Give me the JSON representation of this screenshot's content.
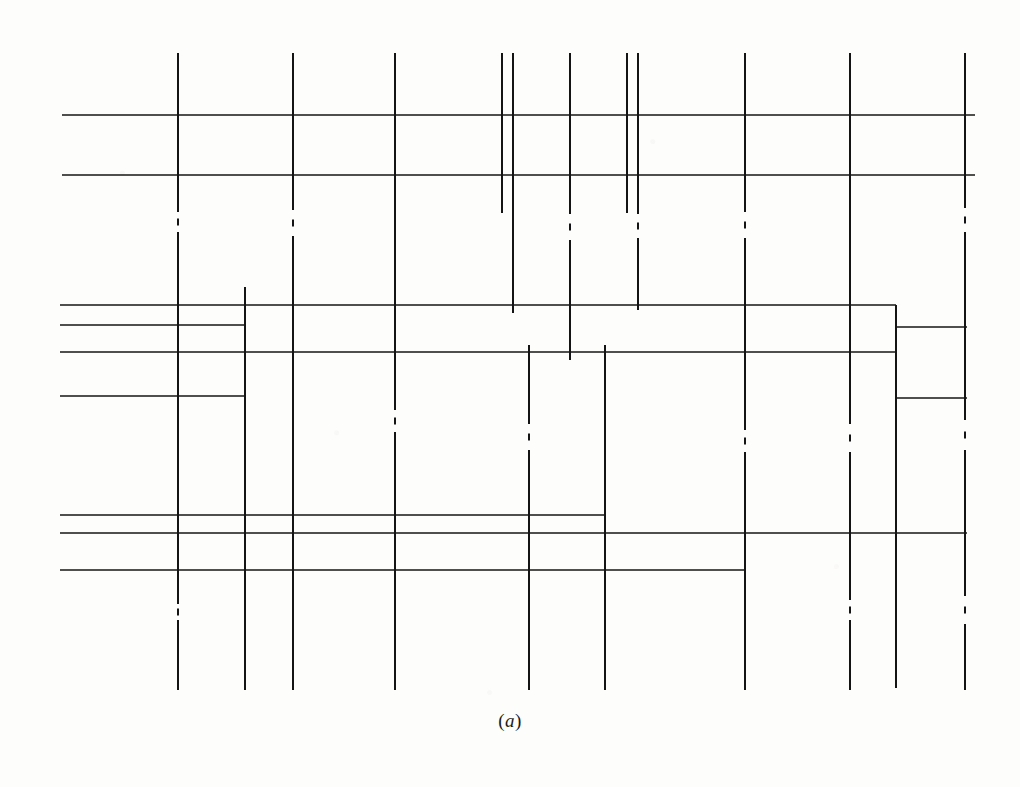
{
  "figure": {
    "caption": "(a)",
    "caption_open_paren": "(",
    "caption_label": "a",
    "caption_close_paren": ")",
    "background_color": "#fdfdfc",
    "line_color": "#141414",
    "canvas": {
      "width": 1020,
      "height": 787
    }
  },
  "drawing": {
    "stroke_width_main": 2.0,
    "stroke_width_thin": 1.6,
    "vertical_lines": [
      {
        "name": "v1",
        "x": 178,
        "y1": 53,
        "y2": 690,
        "style": "dash-dot",
        "gaps": [
          [
            212,
            232
          ],
          [
            604,
            620
          ]
        ]
      },
      {
        "name": "v2",
        "x": 245,
        "y1": 287,
        "y2": 690,
        "style": "solid",
        "gaps": []
      },
      {
        "name": "v3",
        "x": 293,
        "y1": 53,
        "y2": 690,
        "style": "dash-dot",
        "gaps": [
          [
            210,
            236
          ]
        ]
      },
      {
        "name": "v4",
        "x": 395,
        "y1": 53,
        "y2": 690,
        "style": "dash-dot",
        "gaps": [
          [
            410,
            432
          ]
        ]
      },
      {
        "name": "v5",
        "x": 502,
        "y1": 53,
        "y2": 213,
        "style": "solid",
        "gaps": []
      },
      {
        "name": "v6",
        "x": 513,
        "y1": 53,
        "y2": 313,
        "style": "solid",
        "gaps": []
      },
      {
        "name": "v7",
        "x": 529,
        "y1": 345,
        "y2": 690,
        "style": "dash-dot",
        "gaps": [
          [
            424,
            450
          ]
        ]
      },
      {
        "name": "v8",
        "x": 570,
        "y1": 53,
        "y2": 360,
        "style": "dash-dot",
        "gaps": [
          [
            214,
            240
          ]
        ]
      },
      {
        "name": "v9",
        "x": 605,
        "y1": 345,
        "y2": 690,
        "style": "solid",
        "gaps": []
      },
      {
        "name": "v10",
        "x": 627,
        "y1": 53,
        "y2": 213,
        "style": "solid",
        "gaps": []
      },
      {
        "name": "v11",
        "x": 638,
        "y1": 53,
        "y2": 310,
        "style": "dash-dot",
        "gaps": [
          [
            214,
            238
          ]
        ]
      },
      {
        "name": "v12",
        "x": 745,
        "y1": 53,
        "y2": 690,
        "style": "dash-dot",
        "gaps": [
          [
            212,
            238
          ],
          [
            430,
            452
          ]
        ]
      },
      {
        "name": "v13",
        "x": 850,
        "y1": 53,
        "y2": 690,
        "style": "dash-dot",
        "gaps": [
          [
            424,
            452
          ],
          [
            600,
            620
          ]
        ]
      },
      {
        "name": "v14",
        "x": 896,
        "y1": 305,
        "y2": 688,
        "style": "solid",
        "gaps": []
      },
      {
        "name": "v15",
        "x": 965,
        "y1": 53,
        "y2": 690,
        "style": "dash-dot",
        "gaps": [
          [
            208,
            232
          ],
          [
            420,
            450
          ],
          [
            596,
            624
          ]
        ]
      }
    ],
    "horizontal_lines": [
      {
        "name": "h1",
        "y": 115,
        "x1": 62,
        "x2": 975,
        "style": "solid"
      },
      {
        "name": "h2",
        "y": 175,
        "x1": 62,
        "x2": 975,
        "style": "solid"
      },
      {
        "name": "h3",
        "y": 305,
        "x1": 60,
        "x2": 896,
        "style": "solid"
      },
      {
        "name": "h4",
        "y": 325,
        "x1": 60,
        "x2": 245,
        "style": "solid"
      },
      {
        "name": "h5",
        "y": 327,
        "x1": 896,
        "x2": 967,
        "style": "solid"
      },
      {
        "name": "h6",
        "y": 352,
        "x1": 60,
        "x2": 896,
        "style": "solid"
      },
      {
        "name": "h7",
        "y": 396,
        "x1": 60,
        "x2": 245,
        "style": "solid"
      },
      {
        "name": "h8",
        "y": 398,
        "x1": 896,
        "x2": 967,
        "style": "solid"
      },
      {
        "name": "h9",
        "y": 515,
        "x1": 60,
        "x2": 605,
        "style": "solid"
      },
      {
        "name": "h10",
        "y": 533,
        "x1": 60,
        "x2": 967,
        "style": "solid"
      },
      {
        "name": "h11",
        "y": 570,
        "x1": 60,
        "x2": 745,
        "style": "solid"
      }
    ]
  }
}
